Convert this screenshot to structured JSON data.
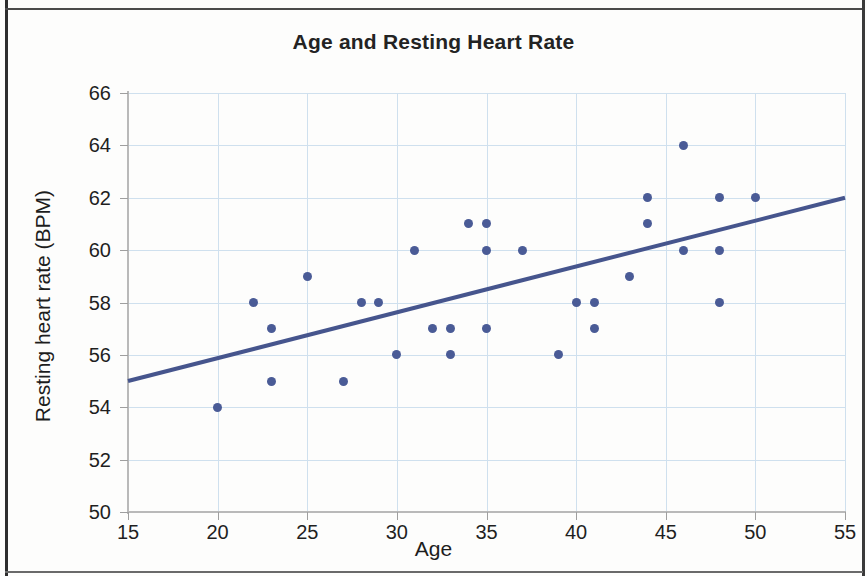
{
  "chart_data": {
    "type": "scatter",
    "title": "Age and Resting Heart Rate",
    "xlabel": "Age",
    "ylabel": "Resting heart rate (BPM)",
    "xlim": [
      15,
      55
    ],
    "ylim": [
      50,
      66
    ],
    "xticks": [
      15,
      20,
      25,
      30,
      35,
      40,
      45,
      50,
      55
    ],
    "yticks": [
      50,
      52,
      54,
      56,
      58,
      60,
      62,
      64,
      66
    ],
    "grid": true,
    "legend": "none",
    "marker_color": "#4a5b96",
    "trendline_color": "#46558d",
    "grid_color": "#cfe0ee",
    "points": [
      {
        "x": 20,
        "y": 54
      },
      {
        "x": 22,
        "y": 58
      },
      {
        "x": 23,
        "y": 57
      },
      {
        "x": 23,
        "y": 55
      },
      {
        "x": 25,
        "y": 59
      },
      {
        "x": 27,
        "y": 55
      },
      {
        "x": 28,
        "y": 58
      },
      {
        "x": 29,
        "y": 58
      },
      {
        "x": 30,
        "y": 56
      },
      {
        "x": 31,
        "y": 60
      },
      {
        "x": 32,
        "y": 57
      },
      {
        "x": 33,
        "y": 57
      },
      {
        "x": 33,
        "y": 56
      },
      {
        "x": 34,
        "y": 61
      },
      {
        "x": 35,
        "y": 61
      },
      {
        "x": 35,
        "y": 60
      },
      {
        "x": 35,
        "y": 57
      },
      {
        "x": 37,
        "y": 60
      },
      {
        "x": 39,
        "y": 56
      },
      {
        "x": 40,
        "y": 58
      },
      {
        "x": 41,
        "y": 58
      },
      {
        "x": 41,
        "y": 57
      },
      {
        "x": 43,
        "y": 59
      },
      {
        "x": 44,
        "y": 62
      },
      {
        "x": 44,
        "y": 61
      },
      {
        "x": 46,
        "y": 64
      },
      {
        "x": 46,
        "y": 60
      },
      {
        "x": 48,
        "y": 62
      },
      {
        "x": 48,
        "y": 60
      },
      {
        "x": 48,
        "y": 58
      },
      {
        "x": 50,
        "y": 62
      }
    ],
    "trendline": {
      "x0": 15,
      "y0": 55,
      "x1": 55,
      "y1": 62
    }
  }
}
